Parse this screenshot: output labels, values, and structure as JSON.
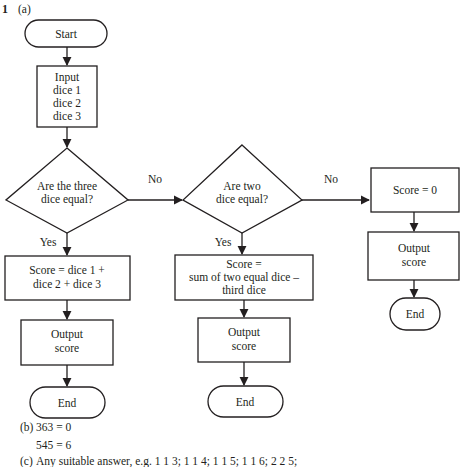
{
  "question": {
    "number": "1",
    "part": "(a)"
  },
  "flowchart": {
    "start": "Start",
    "input": [
      "Input",
      "dice 1",
      "dice 2",
      "dice 3"
    ],
    "decision1": [
      "Are the three",
      "dice equal?"
    ],
    "decision2": [
      "Are two",
      "dice equal?"
    ],
    "yes_label": "Yes",
    "no_label": "No",
    "score_all": [
      "Score = dice 1 +",
      "dice 2 + dice 3"
    ],
    "score_two": [
      "Score =",
      "sum of two equal dice –",
      "third dice"
    ],
    "score_zero": "Score = 0",
    "output": [
      "Output",
      "score"
    ],
    "end": "End"
  },
  "answers": {
    "b_label": "(b)",
    "b_line1": "363 = 0",
    "b_line2": "545 = 6",
    "c_label": "(c)",
    "c_text": "Any suitable answer, e.g. 1 1 3; 1 1 4; 1 1 5; 1 1 6; 2 2 5;"
  }
}
